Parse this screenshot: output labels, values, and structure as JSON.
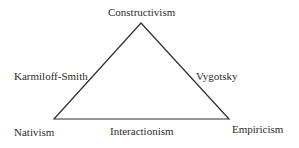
{
  "diagram": {
    "type": "triangle",
    "vertices": {
      "top": "Constructivism",
      "bottom_left": "Nativism",
      "bottom_right": "Empiricism"
    },
    "edges": {
      "left": "Karmiloff-Smith",
      "right": "Vygotsky",
      "bottom": "Interactionism"
    },
    "line_color": "#2f2f2f",
    "text_color": "#2b2b2b",
    "background": "#ffffff"
  }
}
